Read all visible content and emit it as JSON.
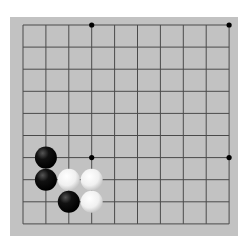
{
  "board": {
    "type": "go",
    "visible_region": "bottom-left corner, 10x10 intersections",
    "columns": 10,
    "rows": 10,
    "edges": [
      "left",
      "bottom"
    ],
    "colors": {
      "board": "#c2c2c2",
      "line": "#4a4a4a",
      "black": "#111111",
      "white": "#f4f4f4"
    },
    "star_points": [
      [
        3,
        0
      ],
      [
        9,
        0
      ],
      [
        3,
        6
      ],
      [
        9,
        6
      ]
    ],
    "stones": [
      {
        "color": "black",
        "col": 1,
        "row": 6
      },
      {
        "color": "black",
        "col": 1,
        "row": 7
      },
      {
        "color": "white",
        "col": 2,
        "row": 7
      },
      {
        "color": "white",
        "col": 3,
        "row": 7
      },
      {
        "color": "black",
        "col": 2,
        "row": 8
      },
      {
        "color": "white",
        "col": 3,
        "row": 8
      }
    ]
  }
}
